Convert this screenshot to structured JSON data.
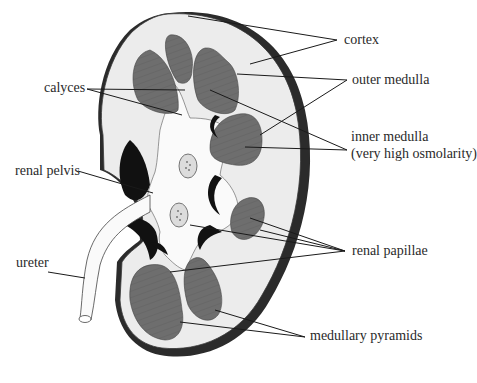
{
  "diagram": {
    "colors": {
      "cortex": "#ececec",
      "pyramid": "#6e6e6e",
      "capsule": "#2b2b2b",
      "pelvis": "#fafafa",
      "vessel_void": "#111111",
      "leader_line": "#1a1a1a"
    },
    "labels": {
      "cortex": "cortex",
      "outer_medulla": "outer medulla",
      "inner_medulla_line1": "inner medulla",
      "inner_medulla_line2": "(very high osmolarity)",
      "calyces": "calyces",
      "renal_pelvis": "renal pelvis",
      "ureter": "ureter",
      "renal_papillae": "renal papillae",
      "medullary_pyramids": "medullary pyramids"
    }
  }
}
